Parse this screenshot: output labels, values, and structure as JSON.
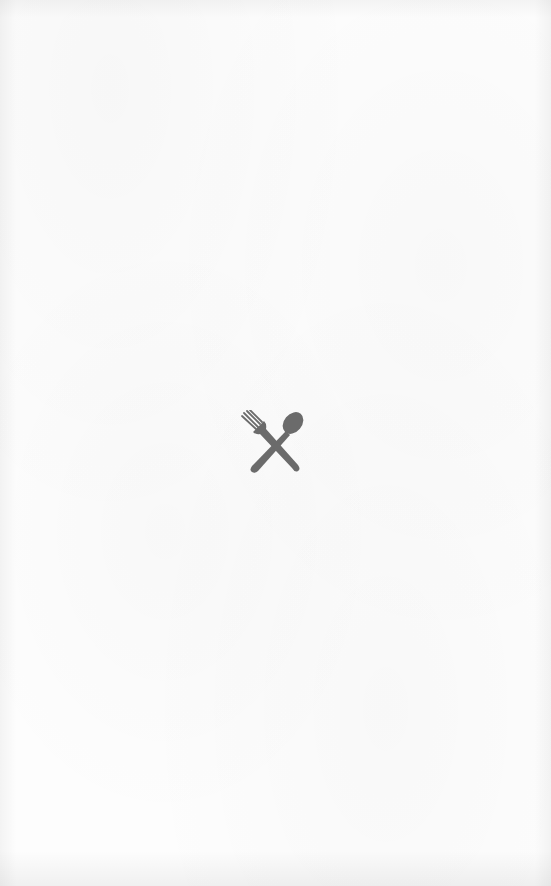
{
  "screen": {
    "type": "splash",
    "background_color": "#fdfdfd"
  },
  "logo": {
    "icon": "fork-and-spoon-crossed-icon",
    "color": "#6b6b6b"
  }
}
